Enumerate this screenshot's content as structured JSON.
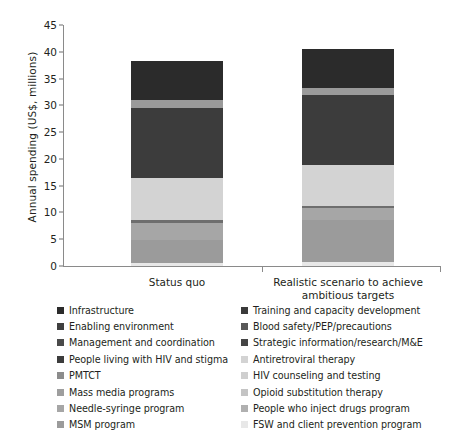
{
  "chart_data": {
    "type": "bar",
    "subtype": "stacked-bar",
    "title": "",
    "xlabel": "",
    "ylabel": "Annual spending (US$, millions)",
    "categories": [
      "Status quo",
      "Realistic scenario to achieve ambitious targets"
    ],
    "ylim": [
      0,
      45
    ],
    "yticks": [
      0,
      5,
      10,
      15,
      20,
      25,
      30,
      35,
      40,
      45
    ],
    "ytick_labels": [
      "0",
      "5",
      "10",
      "15",
      "20",
      "25",
      "30",
      "35",
      "40",
      "45"
    ],
    "grid": false,
    "legend_position": "below",
    "totals": [
      38.3,
      40.5
    ],
    "series": [
      {
        "name": "Infrastructure",
        "color": "#2b2b2b",
        "values": [
          7.3,
          7.2
        ]
      },
      {
        "name": "Training and capacity development",
        "color": "#3a3a3a",
        "values": [
          0.0,
          0.0
        ]
      },
      {
        "name": "Enabling environment",
        "color": "#3f3f3f",
        "values": [
          0.0,
          0.0
        ]
      },
      {
        "name": "Blood safety/PEP/precautions",
        "color": "#9a9a9a",
        "values": [
          1.5,
          1.3
        ]
      },
      {
        "name": "Management and coordination",
        "color": "#4a4a4a",
        "values": [
          0.0,
          0.0
        ]
      },
      {
        "name": "Strategic information/research/M&E",
        "color": "#454545",
        "values": [
          0.0,
          0.0
        ]
      },
      {
        "name": "People living with HIV and stigma",
        "color": "#3c3c3c",
        "values": [
          13.0,
          13.2
        ]
      },
      {
        "name": "Antiretroviral therapy",
        "color": "#d3d3d3",
        "values": [
          8.0,
          7.6
        ]
      },
      {
        "name": "PMTCT",
        "color": "#8c8c8c",
        "values": [
          0.0,
          0.0
        ]
      },
      {
        "name": "HIV counseling and testing",
        "color": "#cfcfcf",
        "values": [
          0.0,
          0.0
        ]
      },
      {
        "name": "Mass media programs",
        "color": "#9e9e9e",
        "values": [
          0.4,
          0.4
        ]
      },
      {
        "name": "Opioid substitution therapy",
        "color": "#c4c4c4",
        "values": [
          0.0,
          0.0
        ]
      },
      {
        "name": "Needle-syringe program",
        "color": "#a6a6a6",
        "values": [
          3.2,
          2.3
        ]
      },
      {
        "name": "People who inject drugs program",
        "color": "#b0b0b0",
        "values": [
          0.0,
          0.0
        ]
      },
      {
        "name": "MSM program",
        "color": "#9b9b9b",
        "values": [
          4.4,
          7.7
        ]
      },
      {
        "name": "FSW and client prevention program",
        "color": "#e8e8e8",
        "values": [
          0.5,
          0.8
        ]
      }
    ],
    "stack_order_bottom_to_top": [
      "FSW and client prevention program",
      "MSM program",
      "Needle-syringe program",
      "Mass media programs",
      "Antiretroviral therapy",
      "People living with HIV and stigma",
      "Blood safety/PEP/precautions",
      "Infrastructure"
    ],
    "bars": [
      {
        "label": "Status quo",
        "total": 38.3,
        "segments": [
          {
            "name": "FSW and client prevention program",
            "from": 0.0,
            "to": 0.5,
            "value": 0.5,
            "color": "#e8e8e8"
          },
          {
            "name": "MSM program",
            "from": 0.5,
            "to": 4.9,
            "value": 4.4,
            "color": "#9b9b9b"
          },
          {
            "name": "Needle-syringe program",
            "from": 4.9,
            "to": 8.1,
            "value": 3.2,
            "color": "#a6a6a6"
          },
          {
            "name": "Mass media programs",
            "from": 8.1,
            "to": 8.5,
            "value": 0.4,
            "color": "#6e6e6e"
          },
          {
            "name": "Antiretroviral therapy",
            "from": 8.5,
            "to": 16.5,
            "value": 8.0,
            "color": "#d3d3d3"
          },
          {
            "name": "People living with HIV and stigma",
            "from": 16.5,
            "to": 29.5,
            "value": 13.0,
            "color": "#3c3c3c"
          },
          {
            "name": "Blood safety/PEP/precautions",
            "from": 29.5,
            "to": 31.0,
            "value": 1.5,
            "color": "#9a9a9a"
          },
          {
            "name": "Infrastructure",
            "from": 31.0,
            "to": 38.3,
            "value": 7.3,
            "color": "#2b2b2b"
          }
        ]
      },
      {
        "label": "Realistic scenario to achieve ambitious targets",
        "total": 40.5,
        "segments": [
          {
            "name": "FSW and client prevention program",
            "from": 0.0,
            "to": 0.8,
            "value": 0.8,
            "color": "#e8e8e8"
          },
          {
            "name": "MSM program",
            "from": 0.8,
            "to": 8.5,
            "value": 7.7,
            "color": "#9b9b9b"
          },
          {
            "name": "Needle-syringe program",
            "from": 8.5,
            "to": 10.8,
            "value": 2.3,
            "color": "#a6a6a6"
          },
          {
            "name": "Mass media programs",
            "from": 10.8,
            "to": 11.2,
            "value": 0.4,
            "color": "#6e6e6e"
          },
          {
            "name": "Antiretroviral therapy",
            "from": 11.2,
            "to": 18.8,
            "value": 7.6,
            "color": "#d3d3d3"
          },
          {
            "name": "People living with HIV and stigma",
            "from": 18.8,
            "to": 32.0,
            "value": 13.2,
            "color": "#3c3c3c"
          },
          {
            "name": "Blood safety/PEP/precautions",
            "from": 32.0,
            "to": 33.3,
            "value": 1.3,
            "color": "#9a9a9a"
          },
          {
            "name": "Infrastructure",
            "from": 33.3,
            "to": 40.5,
            "value": 7.2,
            "color": "#2b2b2b"
          }
        ]
      }
    ]
  },
  "axis": {
    "ylabel": "Annual spending (US$, millions)",
    "ytick_labels": [
      "0",
      "5",
      "10",
      "15",
      "20",
      "25",
      "30",
      "35",
      "40",
      "45"
    ]
  },
  "xlabels": [
    {
      "line1": "Status quo",
      "line2": ""
    },
    {
      "line1": "Realistic scenario to achieve",
      "line2": "ambitious targets"
    }
  ],
  "legend": {
    "left_column": [
      {
        "label": "Infrastructure",
        "color": "#2b2b2b"
      },
      {
        "label": "Enabling environment",
        "color": "#3f3f3f"
      },
      {
        "label": "Management and coordination",
        "color": "#4a4a4a"
      },
      {
        "label": "People living with HIV and stigma",
        "color": "#3c3c3c"
      },
      {
        "label": "PMTCT",
        "color": "#8c8c8c"
      },
      {
        "label": "Mass media programs",
        "color": "#9e9e9e"
      },
      {
        "label": "Needle-syringe program",
        "color": "#a6a6a6"
      },
      {
        "label": "MSM program",
        "color": "#9b9b9b"
      }
    ],
    "right_column": [
      {
        "label": "Training and capacity development",
        "color": "#3a3a3a"
      },
      {
        "label": "Blood safety/PEP/precautions",
        "color": "#585858"
      },
      {
        "label": "Strategic information/research/M&E",
        "color": "#454545"
      },
      {
        "label": "Antiretroviral therapy",
        "color": "#d3d3d3"
      },
      {
        "label": "HIV counseling and testing",
        "color": "#cfcfcf"
      },
      {
        "label": "Opioid substitution therapy",
        "color": "#c4c4c4"
      },
      {
        "label": "People who inject drugs program",
        "color": "#b0b0b0"
      },
      {
        "label": "FSW and client prevention program",
        "color": "#e8e8e8"
      }
    ]
  }
}
